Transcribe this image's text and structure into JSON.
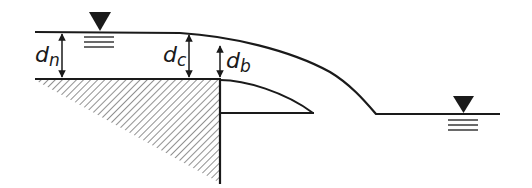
{
  "diagram": {
    "type": "free-overfall brink depth schematic",
    "labels": {
      "dn": {
        "base": "d",
        "sub": "n"
      },
      "dc": {
        "base": "d",
        "sub": "c"
      },
      "db": {
        "base": "d",
        "sub": "b"
      }
    },
    "symbols": {
      "upstream_water_surface": "water-surface-symbol",
      "tailwater_surface": "water-surface-symbol"
    },
    "colors": {
      "line": "#1a1a1a",
      "hatch": "#555555",
      "background": "#ffffff"
    }
  }
}
